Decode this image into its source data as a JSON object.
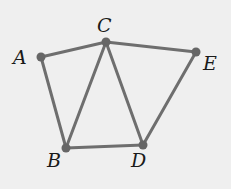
{
  "diagram": {
    "type": "graph",
    "background": "#efefef",
    "edge_color": "#6e6e6e",
    "node_color": "#666666",
    "nodes": [
      {
        "id": "A",
        "label": "A",
        "x": 41,
        "y": 57,
        "lx": 13,
        "ly": 64
      },
      {
        "id": "C",
        "label": "C",
        "x": 106,
        "y": 42,
        "lx": 97,
        "ly": 32
      },
      {
        "id": "E",
        "label": "E",
        "x": 196,
        "y": 52,
        "lx": 203,
        "ly": 70
      },
      {
        "id": "B",
        "label": "B",
        "x": 66,
        "y": 148,
        "lx": 47,
        "ly": 167
      },
      {
        "id": "D",
        "label": "D",
        "x": 143,
        "y": 145,
        "lx": 131,
        "ly": 167
      }
    ],
    "edges": [
      {
        "from": "A",
        "to": "C"
      },
      {
        "from": "A",
        "to": "B"
      },
      {
        "from": "C",
        "to": "B"
      },
      {
        "from": "C",
        "to": "D"
      },
      {
        "from": "C",
        "to": "E"
      },
      {
        "from": "B",
        "to": "D"
      },
      {
        "from": "D",
        "to": "E"
      }
    ]
  }
}
